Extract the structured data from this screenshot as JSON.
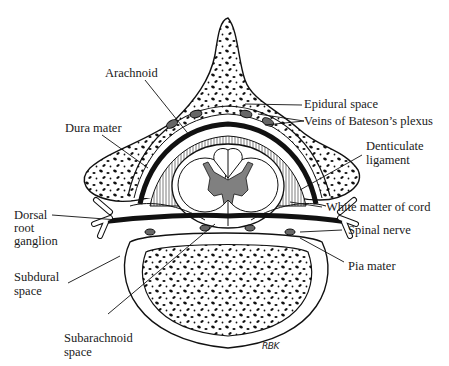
{
  "diagram": {
    "type": "anatomical cross-section",
    "colors": {
      "ink": "#111111",
      "background": "#ffffff",
      "gray_matter": "#808080"
    },
    "labels": {
      "arachnoid": "Arachnoid",
      "dura_mater": "Dura mater",
      "epidural_space": "Epidural space",
      "veins_bateson": "Veins of Bateson’s plexus",
      "denticulate_1": "Denticulate",
      "denticulate_2": "ligament",
      "white_matter": "White matter of cord",
      "dorsal_1": "Dorsal",
      "dorsal_2": "root",
      "dorsal_3": "ganglion",
      "spinal_nerve": "Spinal nerve",
      "subdural_1": "Subdural",
      "subdural_2": "space",
      "pia_mater": "Pia mater",
      "subarachnoid_1": "Subarachnoid",
      "subarachnoid_2": "space"
    },
    "signature": "RBK"
  }
}
